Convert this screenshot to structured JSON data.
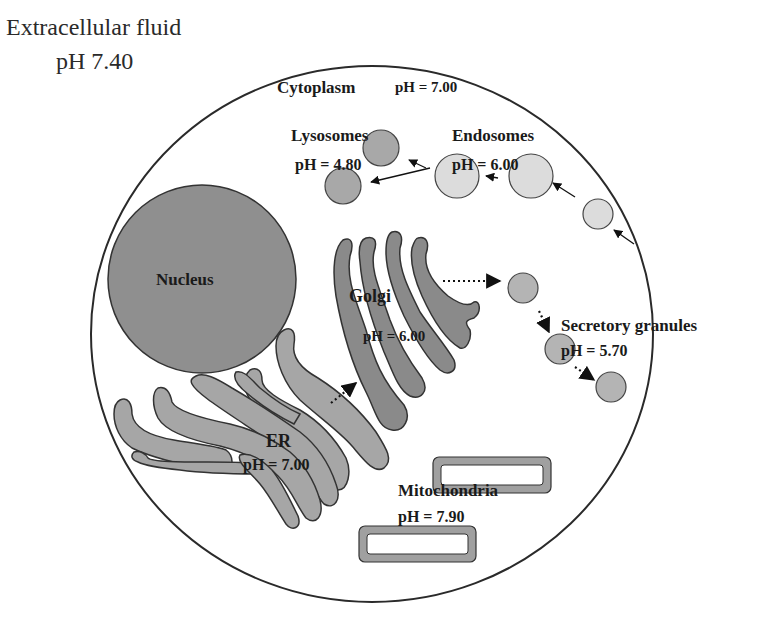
{
  "extracellular": {
    "title": "Extracellular fluid",
    "ph": "pH 7.40"
  },
  "cytoplasm": {
    "label": "Cytoplasm",
    "ph": "pH = 7.00"
  },
  "lysosomes": {
    "label": "Lysosomes",
    "ph": "pH = 4.80"
  },
  "endosomes": {
    "label": "Endosomes",
    "ph": "pH = 6.00"
  },
  "nucleus": {
    "label": "Nucleus"
  },
  "golgi": {
    "label": "Golgi",
    "ph": "pH = 6.00"
  },
  "secretory_granules": {
    "label": "Secretory granules",
    "ph": "pH = 5.70"
  },
  "er": {
    "label": "ER",
    "ph": "pH = 7.00"
  },
  "mitochondria": {
    "label": "Mitochondria",
    "ph": "pH = 7.90"
  },
  "colors": {
    "outline": "#333333",
    "nucleus_fill": "#8f8f8f",
    "golgi_fill": "#8a8a8a",
    "er_fill": "#a6a6a6",
    "lysosome_fill": "#a8a8a8",
    "endosome_fill": "#dcdcdc",
    "granule_fill": "#b4b4b4",
    "mito_fill": "#a0a0a0"
  }
}
